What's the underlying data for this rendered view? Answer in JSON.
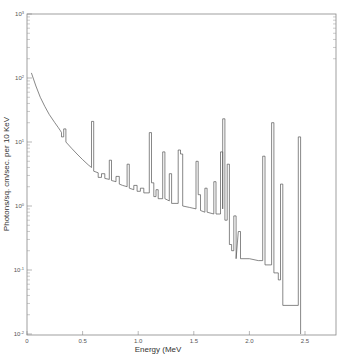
{
  "chart_data": {
    "type": "line",
    "title": "",
    "xlabel": "Energy (MeV",
    "ylabel": "Photons/sq. cm/sec. per 10 KeV",
    "xlim": [
      0,
      2.8
    ],
    "ylim": [
      0.01,
      1000
    ],
    "yscale": "log",
    "grid": false,
    "legend": null,
    "x_ticks": [
      "0",
      "0.5",
      "1.0",
      "1.5",
      "2.0",
      "2.5"
    ],
    "x_tick_values": [
      0,
      0.5,
      1.0,
      1.5,
      2.0,
      2.5
    ],
    "y_ticks": [
      "10^-2",
      "10^-1",
      "10^0",
      "10^1",
      "10^2",
      "10^3"
    ],
    "y_tick_values": [
      0.01,
      0.1,
      1,
      10,
      100,
      1000
    ],
    "series": [
      {
        "name": "gamma-ray spectrum",
        "style": "step",
        "points": [
          [
            0.04,
            120
          ],
          [
            0.08,
            75
          ],
          [
            0.12,
            50
          ],
          [
            0.16,
            36
          ],
          [
            0.2,
            27
          ],
          [
            0.25,
            20
          ],
          [
            0.28,
            17
          ],
          [
            0.3,
            15
          ],
          [
            0.31,
            14
          ],
          [
            0.31,
            12
          ],
          [
            0.33,
            12
          ],
          [
            0.33,
            16
          ],
          [
            0.35,
            16
          ],
          [
            0.35,
            10
          ],
          [
            0.4,
            8
          ],
          [
            0.45,
            6.5
          ],
          [
            0.5,
            5.3
          ],
          [
            0.55,
            4.4
          ],
          [
            0.58,
            4.0
          ],
          [
            0.58,
            21
          ],
          [
            0.6,
            21
          ],
          [
            0.6,
            3.5
          ],
          [
            0.64,
            3.3
          ],
          [
            0.64,
            2.8
          ],
          [
            0.67,
            2.8
          ],
          [
            0.67,
            3.2
          ],
          [
            0.7,
            3.2
          ],
          [
            0.7,
            2.7
          ],
          [
            0.74,
            2.6
          ],
          [
            0.74,
            5.2
          ],
          [
            0.76,
            5.2
          ],
          [
            0.76,
            2.5
          ],
          [
            0.8,
            2.4
          ],
          [
            0.8,
            2.9
          ],
          [
            0.83,
            2.9
          ],
          [
            0.83,
            2.2
          ],
          [
            0.86,
            2.1
          ],
          [
            0.9,
            2.0
          ],
          [
            0.9,
            4.5
          ],
          [
            0.92,
            4.5
          ],
          [
            0.92,
            1.9
          ],
          [
            0.96,
            1.8
          ],
          [
            0.96,
            2.1
          ],
          [
            0.99,
            2.1
          ],
          [
            0.99,
            1.7
          ],
          [
            1.02,
            1.7
          ],
          [
            1.02,
            1.9
          ],
          [
            1.05,
            1.9
          ],
          [
            1.05,
            1.6
          ],
          [
            1.1,
            1.6
          ],
          [
            1.1,
            14
          ],
          [
            1.12,
            14
          ],
          [
            1.12,
            2.3
          ],
          [
            1.14,
            2.3
          ],
          [
            1.14,
            1.4
          ],
          [
            1.16,
            1.4
          ],
          [
            1.16,
            1.8
          ],
          [
            1.18,
            1.8
          ],
          [
            1.18,
            1.3
          ],
          [
            1.22,
            1.3
          ],
          [
            1.22,
            7.0
          ],
          [
            1.24,
            7.0
          ],
          [
            1.24,
            1.3
          ],
          [
            1.28,
            1.2
          ],
          [
            1.28,
            3.2
          ],
          [
            1.3,
            3.2
          ],
          [
            1.3,
            1.1
          ],
          [
            1.36,
            1.1
          ],
          [
            1.36,
            7.5
          ],
          [
            1.38,
            7.5
          ],
          [
            1.38,
            6.5
          ],
          [
            1.4,
            6.5
          ],
          [
            1.4,
            1.0
          ],
          [
            1.46,
            0.95
          ],
          [
            1.52,
            0.9
          ],
          [
            1.52,
            5.0
          ],
          [
            1.54,
            5.0
          ],
          [
            1.54,
            1.5
          ],
          [
            1.56,
            1.5
          ],
          [
            1.56,
            0.85
          ],
          [
            1.6,
            0.8
          ],
          [
            1.6,
            1.9
          ],
          [
            1.62,
            1.9
          ],
          [
            1.62,
            0.8
          ],
          [
            1.68,
            0.75
          ],
          [
            1.68,
            2.4
          ],
          [
            1.7,
            2.4
          ],
          [
            1.7,
            0.75
          ],
          [
            1.74,
            0.75
          ],
          [
            1.74,
            7.0
          ],
          [
            1.76,
            7.0
          ],
          [
            1.76,
            0.9
          ],
          [
            1.76,
            23
          ],
          [
            1.78,
            23
          ],
          [
            1.78,
            0.6
          ],
          [
            1.8,
            0.6
          ],
          [
            1.8,
            4.5
          ],
          [
            1.82,
            4.5
          ],
          [
            1.82,
            0.25
          ],
          [
            1.84,
            0.25
          ],
          [
            1.84,
            0.2
          ],
          [
            1.86,
            0.2
          ],
          [
            1.86,
            0.7
          ],
          [
            1.88,
            0.7
          ],
          [
            1.88,
            0.15
          ],
          [
            1.9,
            0.4
          ],
          [
            1.92,
            0.4
          ],
          [
            1.92,
            0.15
          ],
          [
            2.0,
            0.15
          ],
          [
            2.08,
            0.14
          ],
          [
            2.12,
            0.14
          ],
          [
            2.12,
            6.0
          ],
          [
            2.14,
            6.0
          ],
          [
            2.14,
            0.12
          ],
          [
            2.2,
            0.12
          ],
          [
            2.2,
            20
          ],
          [
            2.22,
            20
          ],
          [
            2.22,
            0.09
          ],
          [
            2.26,
            0.09
          ],
          [
            2.26,
            0.07
          ],
          [
            2.28,
            0.07
          ],
          [
            2.28,
            2.2
          ],
          [
            2.3,
            2.2
          ],
          [
            2.3,
            0.028
          ],
          [
            2.44,
            0.028
          ],
          [
            2.44,
            12
          ],
          [
            2.46,
            12
          ],
          [
            2.46,
            0.01
          ]
        ]
      }
    ]
  }
}
